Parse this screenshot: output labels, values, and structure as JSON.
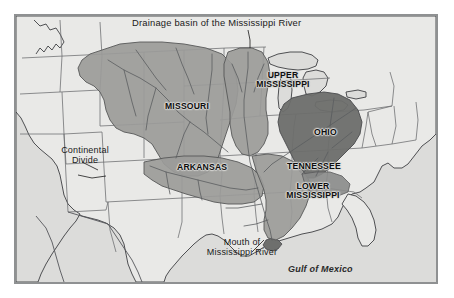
{
  "figure": {
    "kind": "thematic-map",
    "title": "Drainage basin of the Mississippi River",
    "frame_border_color": "#8f9192",
    "background_color": "#ffffff"
  },
  "map": {
    "land_color": "#e6e6e4",
    "water_color": "#dcdcda",
    "state_border_color": "#55565a",
    "coastline_color": "#3d3e42",
    "river_color": "#5a5c60",
    "basin_fill_color": "#9a9a98",
    "basin_dark_fill_color": "#6e6f6d",
    "basin_outline_color": "#4a4b4d"
  },
  "basin_labels": [
    {
      "name": "missouri",
      "text": "MISSOURI",
      "x": 163,
      "y": 104
    },
    {
      "name": "upper-mississippi",
      "text": "UPPER\nMISSISSIPPI",
      "line1": "UPPER",
      "line2": "MISSISSIPPI",
      "x": 241,
      "y": 73
    },
    {
      "name": "ohio",
      "text": "OHIO",
      "x": 311,
      "y": 129
    },
    {
      "name": "arkansas",
      "text": "ARKANSAS",
      "x": 176,
      "y": 165
    },
    {
      "name": "tennessee",
      "text": "TENNESSEE",
      "x": 288,
      "y": 163
    },
    {
      "name": "lower-mississippi",
      "line1": "LOWER",
      "line2": "MISSISSIPPI",
      "x": 272,
      "y": 184
    }
  ],
  "annotations": [
    {
      "name": "continental-divide",
      "line1": "Continental",
      "line2": "Divide",
      "x": 58,
      "y": 147
    },
    {
      "name": "mouth-of-mississippi-river",
      "line1": "Mouth of",
      "line2": "Mississippi River",
      "x": 203,
      "y": 239
    }
  ],
  "sea_labels": [
    {
      "name": "gulf-of-mexico",
      "text": "Gulf of Mexico",
      "x": 300,
      "y": 266
    }
  ],
  "title_position": {
    "x": 130,
    "y": 16
  }
}
